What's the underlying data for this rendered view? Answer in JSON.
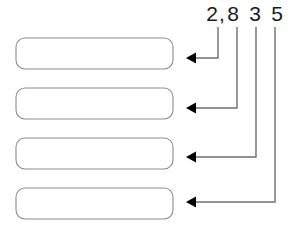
{
  "diagram": {
    "type": "place-value-callout",
    "background_color": "#ffffff",
    "number": {
      "full_value": "2,835",
      "text_color": "#1a1a1a",
      "glyphs": [
        {
          "char": "2",
          "label": "digit-2",
          "x": 212,
          "baseline_y": 21
        },
        {
          "char": ",",
          "label": "comma",
          "x": 222,
          "baseline_y": 21
        },
        {
          "char": "8",
          "label": "digit-8",
          "x": 233,
          "baseline_y": 21
        },
        {
          "char": "3",
          "label": "digit-3",
          "x": 255,
          "baseline_y": 21
        },
        {
          "char": "5",
          "label": "digit-5",
          "x": 277,
          "baseline_y": 21
        }
      ]
    },
    "boxes": {
      "count": 4,
      "fill_color": "#ffffff",
      "border_color": "#8d8d8d",
      "corner_radius": 9,
      "width": 157,
      "height": 31,
      "left_x": 16,
      "items": [
        {
          "name": "answer-box-1",
          "y": 38,
          "value": ""
        },
        {
          "name": "answer-box-2",
          "y": 88,
          "value": ""
        },
        {
          "name": "answer-box-3",
          "y": 138,
          "value": ""
        },
        {
          "name": "answer-box-4",
          "y": 188,
          "value": ""
        }
      ]
    },
    "connectors": {
      "line_color": "#6f6f6f",
      "arrow_color": "#000000",
      "arrow_tip_x": 186,
      "items": [
        {
          "name": "connector-thousands",
          "source_digit": "2",
          "target_box": "answer-box-1",
          "start_x": 218,
          "start_y": 27,
          "corner_y": 58,
          "end_y": 58
        },
        {
          "name": "connector-hundreds",
          "source_digit": "8",
          "target_box": "answer-box-2",
          "start_x": 237,
          "start_y": 27,
          "corner_y": 108,
          "end_y": 108
        },
        {
          "name": "connector-tens",
          "source_digit": "3",
          "target_box": "answer-box-3",
          "start_x": 256,
          "start_y": 27,
          "corner_y": 157,
          "end_y": 157
        },
        {
          "name": "connector-ones",
          "source_digit": "5",
          "target_box": "answer-box-4",
          "start_x": 275,
          "start_y": 27,
          "corner_y": 202,
          "end_y": 202
        }
      ]
    }
  }
}
